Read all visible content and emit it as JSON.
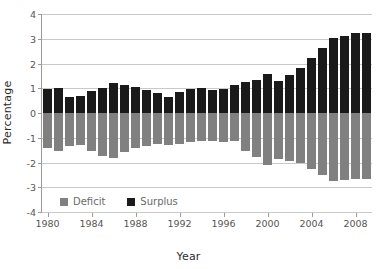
{
  "chart_data": {
    "type": "bar",
    "title": "",
    "xlabel": "Year",
    "ylabel": "Percentage",
    "ylim": [
      -4,
      4
    ],
    "yticks": [
      4,
      3,
      2,
      1,
      0,
      -1,
      -2,
      -3,
      -4
    ],
    "ytick_labels": [
      "4",
      "3",
      "2",
      "1",
      "0",
      "-1",
      "-2",
      "-3",
      "-4"
    ],
    "xticks": [
      1980,
      1984,
      1988,
      1992,
      1996,
      2000,
      2004,
      2008
    ],
    "xtick_labels": [
      "1980",
      "1984",
      "1988",
      "1992",
      "1996",
      "2000",
      "2004",
      "2008"
    ],
    "grid": true,
    "legend_position": "inside-lower-left",
    "categories": [
      1980,
      1981,
      1982,
      1983,
      1984,
      1985,
      1986,
      1987,
      1988,
      1989,
      1990,
      1991,
      1992,
      1993,
      1994,
      1995,
      1996,
      1997,
      1998,
      1999,
      2000,
      2001,
      2002,
      2003,
      2004,
      2005,
      2006,
      2007,
      2008,
      2009
    ],
    "series": [
      {
        "name": "Surplus",
        "color": "#1a1a1a",
        "values": [
          0.98,
          1.02,
          0.65,
          0.68,
          0.88,
          1.02,
          1.23,
          1.12,
          1.04,
          0.93,
          0.8,
          0.66,
          0.83,
          0.98,
          1.0,
          0.93,
          0.98,
          1.15,
          1.25,
          1.33,
          1.57,
          1.28,
          1.52,
          1.82,
          2.22,
          2.64,
          3.04,
          3.12,
          3.22,
          3.24
        ]
      },
      {
        "name": "Deficit",
        "color": "#808080",
        "values": [
          -1.43,
          -1.54,
          -1.35,
          -1.31,
          -1.55,
          -1.72,
          -1.8,
          -1.57,
          -1.4,
          -1.32,
          -1.25,
          -1.3,
          -1.26,
          -1.18,
          -1.15,
          -1.13,
          -1.16,
          -1.14,
          -1.54,
          -1.77,
          -2.1,
          -1.84,
          -1.94,
          -2.02,
          -2.25,
          -2.52,
          -2.73,
          -2.7,
          -2.67,
          -2.67
        ]
      }
    ],
    "legend": [
      {
        "label": "Deficit",
        "color": "#808080"
      },
      {
        "label": "Surplus",
        "color": "#1a1a1a"
      }
    ]
  },
  "style": {
    "background": "#ffffff",
    "grid_color": "#c9c9c9",
    "axis_color": "#9a9a9a",
    "tick_label_color": "#555555",
    "axis_title_color": "#2b2b2b",
    "legend_text_color": "#6a6a6a"
  }
}
